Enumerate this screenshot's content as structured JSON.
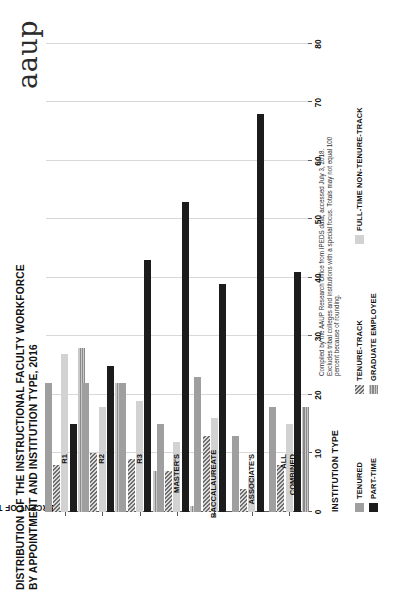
{
  "brand": "aaup",
  "title": "DISTRIBUTION OF THE INSTRUCTIONAL FACULTY WORKFORCE BY APPOINTMENT AND INSTITUTION TYPE, 2016",
  "xaxis_title": "INSTITUTION TYPE",
  "source_note": "Compiled by the AAUP Research Office from IPEDS data; accessed July 3, 2018. Excludes tribal colleges and institutions with a special focus. Totals may not equal 100 percent because of rounding.",
  "legend": [
    {
      "label": "TENURED",
      "swatch": "tenured",
      "color": "#9f9f9f"
    },
    {
      "label": "TENURE-TRACK",
      "swatch": "tt",
      "color": "#6e6e6e"
    },
    {
      "label": "FULL-TIME NON-TENURE-TRACK",
      "swatch": "ftntt",
      "color": "#d2d2d2"
    },
    {
      "label": "PART-TIME",
      "swatch": "pt",
      "color": "#1c1c1c"
    },
    {
      "label": "GRADUATE EMPLOYEE",
      "swatch": "grad",
      "color": "#8a8a8a"
    }
  ],
  "chart_data": {
    "type": "bar",
    "orientation": "horizontal-grouped",
    "title": "DISTRIBUTION OF THE INSTRUCTIONAL FACULTY WORKFORCE BY APPOINTMENT AND INSTITUTION TYPE, 2016",
    "xlabel": "INSTITUTION TYPE",
    "ylabel": "PERCENT OF TOTAL INSTRUCTIONAL FACULTY",
    "ylim": [
      0,
      80
    ],
    "yticks": [
      0,
      10,
      20,
      30,
      40,
      50,
      60,
      70,
      80
    ],
    "grid": true,
    "legend_position": "bottom",
    "categories": [
      "R1",
      "R2",
      "R3",
      "MASTER'S",
      "BACCALAUREATE",
      "ASSOCIATE'S",
      "ALL\nCOMBINED"
    ],
    "series": [
      {
        "name": "TENURED",
        "values": [
          22,
          22,
          22,
          15,
          23,
          13,
          18
        ]
      },
      {
        "name": "TENURE-TRACK",
        "values": [
          8,
          10,
          9,
          7,
          13,
          4,
          8
        ]
      },
      {
        "name": "FULL-TIME NON-TENURE-TRACK",
        "values": [
          27,
          18,
          19,
          12,
          16,
          6,
          15
        ]
      },
      {
        "name": "PART-TIME",
        "values": [
          15,
          25,
          43,
          53,
          39,
          68,
          41
        ]
      },
      {
        "name": "GRADUATE EMPLOYEE",
        "values": [
          28,
          22,
          7,
          1,
          0,
          0,
          18
        ]
      }
    ]
  }
}
